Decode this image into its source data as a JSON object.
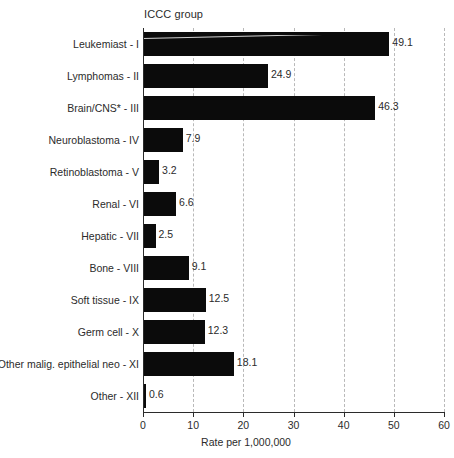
{
  "chart_data": {
    "type": "bar",
    "orientation": "horizontal",
    "title": "ICCC group",
    "xlabel": "Rate per 1,000,000",
    "ylabel": "",
    "xlim": [
      0,
      60
    ],
    "xticks": [
      0,
      10,
      20,
      30,
      40,
      50,
      60
    ],
    "xtick_labels": [
      "0",
      "10",
      "20",
      "30",
      "40",
      "50",
      "60"
    ],
    "grid": "vertical-dashed",
    "legend": null,
    "bar_color": "#0b0b0b",
    "gridline_color": "#b9b9b9",
    "axis_color": "#2b2b2b",
    "background_color": "#ffffff",
    "value_labels_shown": true,
    "categories": [
      "Leukemiast - I",
      "Lymphomas - II",
      "Brain/CNS* - III",
      "Neuroblastoma - IV",
      "Retinoblastoma - V",
      "Renal - VI",
      "Hepatic - VII",
      "Bone - VIII",
      "Soft tissue - IX",
      "Germ cell - X",
      "Other malig. epithelial neo - XI",
      "Other - XII"
    ],
    "values": [
      49.1,
      24.9,
      46.3,
      7.9,
      3.2,
      6.6,
      2.5,
      9.1,
      12.5,
      12.3,
      18.1,
      0.6
    ],
    "value_labels": [
      "49.1",
      "24.9",
      "46.3",
      "7.9",
      "3.2",
      "6.6",
      "2.5",
      "9.1",
      "12.5",
      "12.3",
      "18.1",
      "0.6"
    ],
    "series": [
      {
        "name": "Rate per 1,000,000",
        "values": [
          49.1,
          24.9,
          46.3,
          7.9,
          3.2,
          6.6,
          2.5,
          9.1,
          12.5,
          12.3,
          18.1,
          0.6
        ]
      }
    ]
  }
}
